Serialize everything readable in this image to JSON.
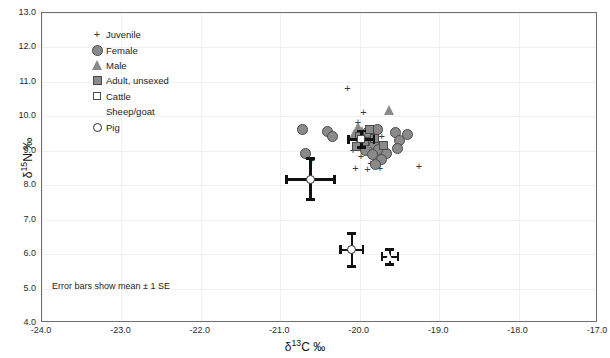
{
  "chart_data": {
    "type": "scatter",
    "title": "",
    "xlabel": "δ¹³C ‰",
    "ylabel": "δ¹⁵N ‰",
    "xlim": [
      -24.0,
      -17.0
    ],
    "ylim": [
      4.0,
      13.0
    ],
    "xticks": [
      "-24.0",
      "-23.0",
      "-22.0",
      "-21.0",
      "-20.0",
      "-19.0",
      "-18.0",
      "-17.0"
    ],
    "yticks": [
      "4.0",
      "5.0",
      "6.0",
      "7.0",
      "8.0",
      "9.0",
      "10.0",
      "11.0",
      "12.0",
      "13.0"
    ],
    "grid": true,
    "legend_position": "top-left",
    "annotation": "Error bars show mean ± 1 SE",
    "marker_color": "#8a8a8a",
    "marker_edge_color": "#4a4a4a",
    "errorbar_color": "#111111",
    "legend": [
      {
        "label": "Juvenile",
        "symbol": "plus"
      },
      {
        "label": "Female",
        "symbol": "filled-circle"
      },
      {
        "label": "Male",
        "symbol": "filled-triangle"
      },
      {
        "label": "Adult, unsexed",
        "symbol": "filled-square"
      },
      {
        "label": "Cattle",
        "symbol": "open-square"
      },
      {
        "label": "Sheep/goat",
        "symbol": "open-triangle"
      },
      {
        "label": "Pig",
        "symbol": "open-circle"
      }
    ],
    "series": [
      {
        "name": "Juvenile",
        "symbol": "plus",
        "points": [
          [
            -20.15,
            10.8
          ],
          [
            -19.95,
            10.1
          ],
          [
            -20.43,
            9.52
          ],
          [
            -20.6,
            8.7
          ],
          [
            -20.02,
            9.8
          ],
          [
            -19.93,
            9.55
          ],
          [
            -19.88,
            9.3
          ],
          [
            -19.8,
            9.12
          ],
          [
            -19.72,
            9.4
          ],
          [
            -19.98,
            8.82
          ],
          [
            -19.86,
            8.62
          ],
          [
            -20.05,
            8.46
          ],
          [
            -19.9,
            8.45
          ],
          [
            -19.74,
            8.48
          ],
          [
            -19.63,
            8.95
          ],
          [
            -19.25,
            8.52
          ],
          [
            -20.08,
            9.0
          ],
          [
            -19.7,
            8.88
          ]
        ]
      },
      {
        "name": "Female",
        "symbol": "filled-circle",
        "points": [
          [
            -20.72,
            9.62
          ],
          [
            -20.4,
            9.55
          ],
          [
            -20.34,
            9.42
          ],
          [
            -20.68,
            8.92
          ],
          [
            -19.97,
            9.46
          ],
          [
            -19.88,
            9.32
          ],
          [
            -19.82,
            9.18
          ],
          [
            -19.76,
            9.05
          ],
          [
            -19.93,
            9.02
          ],
          [
            -19.84,
            8.88
          ],
          [
            -19.78,
            9.62
          ],
          [
            -19.55,
            9.52
          ],
          [
            -19.5,
            9.3
          ],
          [
            -19.4,
            9.48
          ],
          [
            -19.52,
            9.08
          ],
          [
            -19.66,
            8.92
          ],
          [
            -19.72,
            8.74
          ],
          [
            -19.8,
            8.6
          ],
          [
            -19.9,
            9.52
          ]
        ]
      },
      {
        "name": "Male",
        "symbol": "filled-triangle",
        "points": [
          [
            -19.62,
            10.18
          ],
          [
            -20.02,
            9.68
          ],
          [
            -19.96,
            9.58
          ],
          [
            -20.06,
            9.5
          ],
          [
            -20.0,
            9.3
          ],
          [
            -19.93,
            9.22
          ]
        ]
      },
      {
        "name": "Adult, unsexed",
        "symbol": "filled-square",
        "points": [
          [
            -19.88,
            9.62
          ],
          [
            -20.0,
            9.42
          ],
          [
            -19.94,
            9.26
          ],
          [
            -20.04,
            9.12
          ],
          [
            -19.82,
            9.36
          ],
          [
            -19.7,
            9.14
          ]
        ]
      },
      {
        "name": "Cattle (mean)",
        "symbol": "open-square",
        "points": [
          [
            -19.98,
            9.34
          ]
        ],
        "errors": {
          "x": 0.16,
          "y": 0.24
        }
      },
      {
        "name": "Sheep/goat (mean)",
        "symbol": "open-triangle",
        "points": [
          [
            -19.62,
            5.92
          ]
        ],
        "errors": {
          "x": 0.1,
          "y": 0.22
        }
      },
      {
        "name": "Pig (mean, upper)",
        "symbol": "open-circle",
        "points": [
          [
            -20.62,
            8.18
          ]
        ],
        "errors": {
          "x": 0.3,
          "y": 0.6
        }
      },
      {
        "name": "Pig (mean, lower)",
        "symbol": "open-circle",
        "points": [
          [
            -20.1,
            6.12
          ]
        ],
        "errors": {
          "x": 0.14,
          "y": 0.48
        }
      }
    ]
  }
}
